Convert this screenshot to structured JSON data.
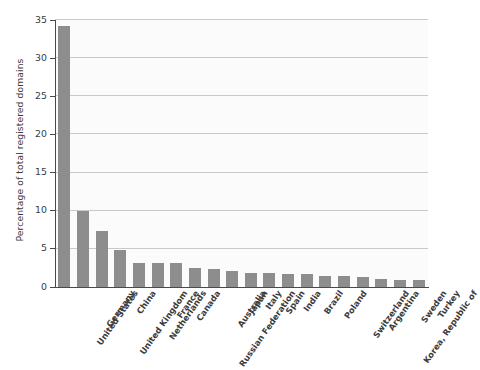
{
  "chart_data": {
    "type": "bar",
    "title": "",
    "xlabel": "",
    "ylabel": "Percentage of total registered domains",
    "ylim": [
      0,
      35
    ],
    "yticks": [
      0,
      5,
      10,
      15,
      20,
      25,
      30,
      35
    ],
    "ytick_labels": [
      "0",
      "5",
      "10",
      "15",
      "20",
      "25",
      "30",
      "35"
    ],
    "grid": true,
    "legend": "none",
    "bar_color": "#8d8d8d",
    "plot_background": "#fbfbfb",
    "gridline_color": "#c9c9c9",
    "axis_color": "#4a4a4a",
    "categories": [
      "United States",
      "Germany",
      "United Kingdom",
      "China",
      "Netherlands",
      "France",
      "Canada",
      "Russian Federation",
      "Australia",
      "Japan",
      "Italy",
      "Spain",
      "India",
      "Brazil",
      "Poland",
      "Switzerland",
      "Argentina",
      "Korea, Republic of",
      "Sweden",
      "Turkey"
    ],
    "values": [
      34.2,
      9.9,
      7.3,
      4.9,
      3.1,
      3.1,
      3.1,
      2.5,
      2.3,
      2.1,
      1.9,
      1.8,
      1.7,
      1.7,
      1.5,
      1.4,
      1.3,
      1.0,
      0.9,
      0.9
    ]
  }
}
